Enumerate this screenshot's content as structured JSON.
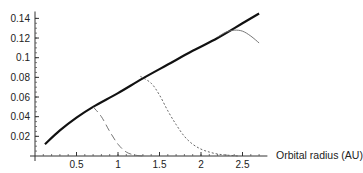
{
  "chart_data": {
    "type": "line",
    "title": "",
    "xlabel": "Orbital radius (AU)",
    "ylabel": "",
    "xlim": [
      0,
      2.8
    ],
    "ylim": [
      0,
      0.145
    ],
    "grid": false,
    "legend": null,
    "x_ticks": [
      0.5,
      1,
      1.5,
      2,
      2.5
    ],
    "x_tick_labels": [
      "0.5",
      "1",
      "1.5",
      "2",
      "2.5"
    ],
    "y_ticks": [
      0.02,
      0.04,
      0.06,
      0.08,
      0.1,
      0.12,
      0.14
    ],
    "y_tick_labels": [
      "0.02",
      "0.04",
      "0.06",
      "0.08",
      "0.1",
      "0.12",
      "0.14"
    ],
    "series": [
      {
        "name": "envelope",
        "style": "thick-solid",
        "x": [
          0.12,
          0.3,
          0.5,
          0.7,
          1.0,
          1.3,
          1.6,
          1.9,
          2.2,
          2.5,
          2.7
        ],
        "y": [
          0.012,
          0.026,
          0.039,
          0.05,
          0.064,
          0.079,
          0.093,
          0.107,
          0.12,
          0.135,
          0.145
        ]
      },
      {
        "name": "dashed",
        "style": "dashed",
        "x": [
          0.7,
          0.8,
          0.9,
          1.0,
          1.1,
          1.2,
          1.3
        ],
        "y": [
          0.05,
          0.04,
          0.025,
          0.012,
          0.004,
          0.001,
          0.0
        ]
      },
      {
        "name": "dotted",
        "style": "dotted",
        "x": [
          1.27,
          1.4,
          1.5,
          1.6,
          1.7,
          1.8,
          1.9,
          2.0,
          2.1,
          2.2,
          2.3,
          2.45
        ],
        "y": [
          0.081,
          0.074,
          0.062,
          0.046,
          0.032,
          0.02,
          0.012,
          0.007,
          0.004,
          0.002,
          0.001,
          0.0
        ]
      },
      {
        "name": "thin-solid",
        "style": "thin-solid",
        "x": [
          2.2,
          2.3,
          2.4,
          2.5,
          2.6,
          2.7
        ],
        "y": [
          0.121,
          0.126,
          0.128,
          0.127,
          0.122,
          0.115
        ]
      }
    ]
  }
}
